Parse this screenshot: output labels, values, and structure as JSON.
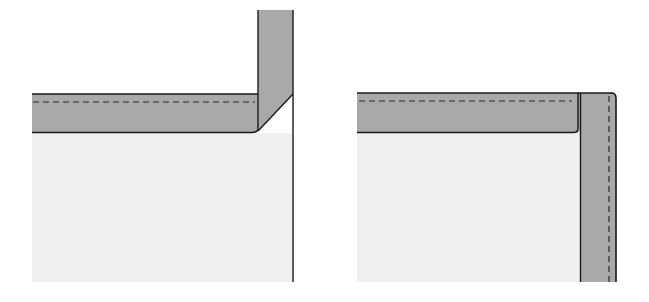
{
  "diagram": {
    "colors": {
      "background": "#ffffff",
      "panel": "#efefef",
      "binding": "#a9a9a9",
      "outline": "#1a1a1a",
      "stitch": "#2a2a2a"
    },
    "figures": [
      {
        "id": "left",
        "name": "mitered-fold-corner",
        "panel": {
          "x": 32,
          "y": 133,
          "w": 261,
          "h": 149
        },
        "horizontal_band": {
          "x": 32,
          "y": 94,
          "w": 228,
          "h": 39,
          "stitch_y": 102
        },
        "vertical_strip": {
          "x": 258,
          "y": 10,
          "w": 35,
          "h": 84
        },
        "diagonal": {
          "x1": 293,
          "y1": 94,
          "x2": 258,
          "y2": 133
        }
      },
      {
        "id": "right",
        "name": "overlapped-corner",
        "panel": {
          "x": 357,
          "y": 133,
          "w": 260,
          "h": 149
        },
        "horizontal_band": {
          "x": 357,
          "y": 93,
          "w": 223,
          "h": 40,
          "stitch_y": 101
        },
        "vertical_strip": {
          "x": 580,
          "y": 93,
          "w": 36,
          "h": 189,
          "stitch_x": 609
        }
      }
    ]
  }
}
